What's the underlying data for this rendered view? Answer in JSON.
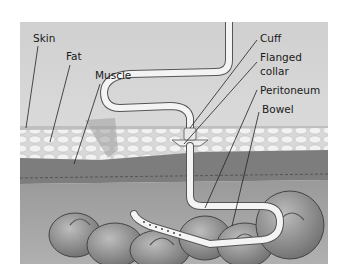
{
  "diagram": {
    "labels": {
      "skin": "Skin",
      "fat": "Fat",
      "muscle": "Muscle",
      "cuff": "Cuff",
      "flanged_collar_line1": "Flanged",
      "flanged_collar_line2": "collar",
      "peritoneum": "Peritoneum",
      "bowel": "Bowel"
    },
    "colors": {
      "background": "#ffffff",
      "sky": "#d6d6d6",
      "fat": "#e4e4e4",
      "muscle": "#7d7d7d",
      "cavity": "#a3a3a3",
      "bowel": "#8e8e8e",
      "tube": "#f2f2f2",
      "leader": "#222222"
    }
  }
}
